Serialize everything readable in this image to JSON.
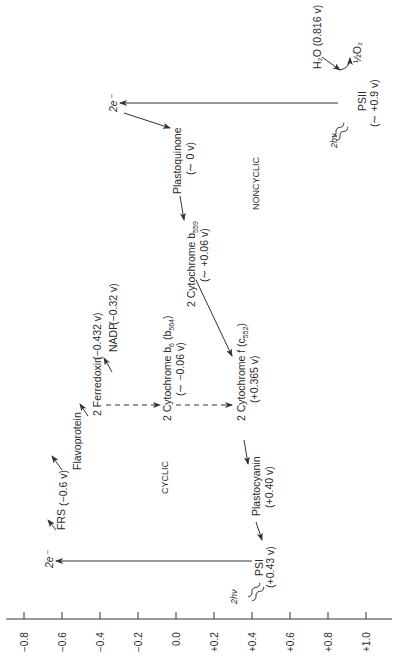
{
  "axis": {
    "ticks": [
      "−0.8",
      "−0.6",
      "−0.4",
      "−0.2",
      "0.0",
      "+0.2",
      "+0.4",
      "+0.6",
      "+0.8",
      "+1.0"
    ]
  },
  "regions": {
    "cyclic": "CYCLIC",
    "noncyclic": "NONCYCLIC"
  },
  "nodes": {
    "ps1": {
      "name": "PSI",
      "potential": "(+0.43 v)"
    },
    "ps1_light": "2hν",
    "ps1_electrons": "2e⁻",
    "frs": {
      "name": "FRS",
      "potential": "(−0.6 v)"
    },
    "flavoprotein": {
      "name": "Flavoprotein"
    },
    "ferredoxin": {
      "name": "2 Ferredoxin",
      "potential": "(−0.432 v)"
    },
    "nadp": {
      "name": "NADP",
      "potential": "(−0.32 v)"
    },
    "cyt_b6": {
      "name": "2 Cytochrome b",
      "sub": "6",
      "extra": "(b",
      "extra_sub": "564",
      "extra_close": ")",
      "potential": "(∼ −0.06 v)"
    },
    "cyt_f": {
      "name": "2 Cytochrome f",
      "extra": "(c",
      "extra_sub": "552",
      "extra_close": ")",
      "potential": "(+0.365 v)"
    },
    "plastocyanin": {
      "name": "Plastocyanin",
      "potential": "(+0.40 v)"
    },
    "cyt_b559": {
      "name": "2 Cytochrome b",
      "sub": "559",
      "potential": "(∼ +0.06 v)"
    },
    "plastoquinone": {
      "name": "Plastoquinone",
      "potential": "(∼ 0 v)"
    },
    "ps2": {
      "name": "PSII",
      "potential": "(∼ +0.9 v)"
    },
    "ps2_light": "2hν",
    "ps2_electrons": "2e⁻",
    "water": {
      "name": "H₂O",
      "potential": "(0.816 v)"
    },
    "oxygen": "½O₂"
  }
}
